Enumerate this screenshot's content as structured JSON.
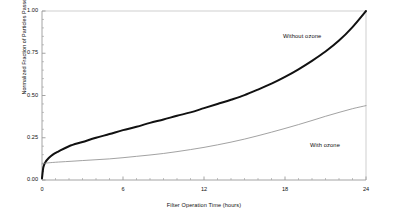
{
  "chart_data": {
    "type": "line",
    "title": "",
    "subtitle": "",
    "xlabel": "Filter Operation Time (hours)",
    "ylabel": "Normalized Fraction of Particles Passed",
    "xlim": [
      0,
      24
    ],
    "ylim": [
      0.0,
      1.0
    ],
    "xticks": [
      0,
      6,
      12,
      18,
      24
    ],
    "xtick_labels": [
      "0",
      "6",
      "12",
      "18",
      "24"
    ],
    "yticks": [
      0.0,
      0.25,
      0.5,
      0.75,
      1.0
    ],
    "ytick_labels": [
      "0.00",
      "0.25",
      "0.50",
      "0.75",
      "1.00"
    ],
    "x_minor_tick_step": 1,
    "y_minor_tick_step": 0.05,
    "grid": false,
    "legend_position": "inline-annotation",
    "frame_color": "#c9c9c9",
    "axis_color": "#9a9a9a",
    "series": [
      {
        "name": "Without ozone",
        "color": "#111111",
        "line_width": 2.0,
        "annotation": "Without ozone",
        "x": [
          0,
          0.1,
          0.25,
          0.5,
          0.8,
          1.2,
          2,
          3,
          4,
          5,
          6,
          7,
          8,
          9,
          10,
          11,
          12,
          13,
          14,
          15,
          16,
          17,
          18,
          19,
          20,
          21,
          22,
          23,
          24
        ],
        "values": [
          0.01,
          0.075,
          0.105,
          0.13,
          0.15,
          0.168,
          0.2,
          0.225,
          0.25,
          0.272,
          0.295,
          0.315,
          0.338,
          0.358,
          0.38,
          0.4,
          0.425,
          0.45,
          0.475,
          0.502,
          0.535,
          0.57,
          0.61,
          0.655,
          0.705,
          0.76,
          0.825,
          0.905,
          1.0
        ]
      },
      {
        "name": "With ozone",
        "color": "#8a8a8a",
        "line_width": 0.8,
        "annotation": "With ozone",
        "x": [
          0,
          0.3,
          1,
          2,
          3,
          4,
          5,
          6,
          7,
          8,
          9,
          10,
          11,
          12,
          13,
          14,
          15,
          16,
          17,
          18,
          19,
          20,
          21,
          22,
          23,
          24
        ],
        "values": [
          0.095,
          0.1,
          0.105,
          0.11,
          0.115,
          0.12,
          0.125,
          0.132,
          0.14,
          0.148,
          0.157,
          0.168,
          0.18,
          0.193,
          0.208,
          0.224,
          0.242,
          0.262,
          0.283,
          0.305,
          0.328,
          0.352,
          0.377,
          0.4,
          0.422,
          0.44
        ]
      }
    ]
  },
  "annotations": {
    "without_ozone": "Without ozone",
    "with_ozone": "With ozone"
  }
}
